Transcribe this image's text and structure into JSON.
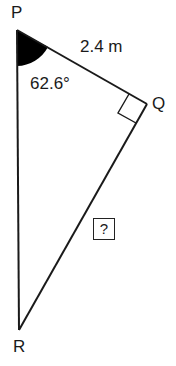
{
  "diagram": {
    "type": "right triangle",
    "vertices": {
      "P": "P",
      "Q": "Q",
      "R": "R"
    },
    "side_PQ": "2.4 m",
    "angle_P": "62.6°",
    "right_angle_at": "Q",
    "unknown_side": "?"
  },
  "colors": {
    "line": "#1a1a1a",
    "angle_fill": "#000000",
    "background": "#ffffff"
  }
}
